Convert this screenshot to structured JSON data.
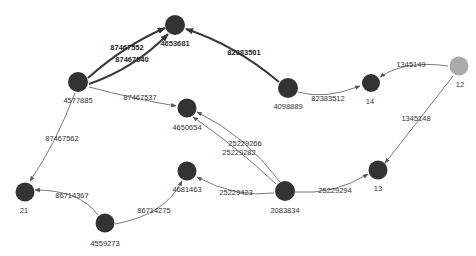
{
  "graph": {
    "node_color": "#333333",
    "highlight_node_color": "#aaaaaa",
    "edge_color": "#6a6a6a",
    "nodes": [
      {
        "id": "4653681",
        "label": "4653681",
        "bold": true
      },
      {
        "id": "4577885",
        "label": "4577885"
      },
      {
        "id": "4098889",
        "label": "4098889"
      },
      {
        "id": "14",
        "label": "14"
      },
      {
        "id": "12",
        "label": "12",
        "highlighted": true
      },
      {
        "id": "4650654",
        "label": "4650654"
      },
      {
        "id": "4681463",
        "label": "4681463"
      },
      {
        "id": "2083834",
        "label": "2083834"
      },
      {
        "id": "13",
        "label": "13"
      },
      {
        "id": "21",
        "label": "21"
      },
      {
        "id": "4559273",
        "label": "4559273"
      }
    ],
    "edges": [
      {
        "label": "87467552",
        "source": "4577885",
        "target": "4653681",
        "bold": true
      },
      {
        "label": "87467540",
        "source": "4577885",
        "target": "4653681",
        "bold": true
      },
      {
        "label": "82383501",
        "source": "4098889",
        "target": "4653681",
        "bold": true
      },
      {
        "label": "87467537",
        "source": "4577885",
        "target": "4650654"
      },
      {
        "label": "87467562",
        "source": "4577885",
        "target": "21"
      },
      {
        "label": "82383512",
        "source": "4098889",
        "target": "14"
      },
      {
        "label": "1345149",
        "source": "12",
        "target": "14"
      },
      {
        "label": "1345148",
        "source": "12",
        "target": "13"
      },
      {
        "label": "25229266",
        "source": "2083834",
        "target": "4650654"
      },
      {
        "label": "25229282",
        "source": "2083834",
        "target": "4650654"
      },
      {
        "label": "25229423",
        "source": "2083834",
        "target": "4681463"
      },
      {
        "label": "25229294",
        "source": "2083834",
        "target": "13"
      },
      {
        "label": "86714367",
        "source": "4559273",
        "target": "21"
      },
      {
        "label": "86714275",
        "source": "4559273",
        "target": "4681463"
      }
    ]
  }
}
